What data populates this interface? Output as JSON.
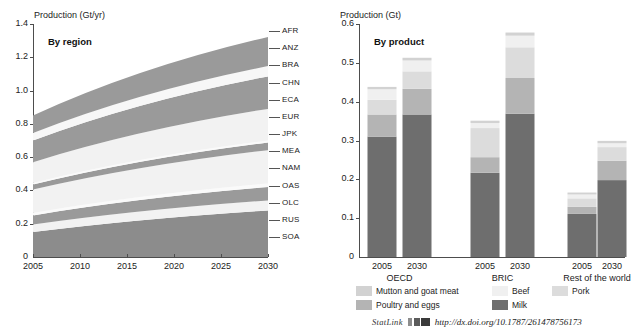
{
  "figure": {
    "statlink": {
      "label": "StatLink",
      "glyph": "statlink-barcode-icon",
      "url": "http://dx.doi.org/10.1787/261478756173"
    }
  },
  "left_panel": {
    "caption": "By region",
    "axis_title": "Production (Gt/yr)"
  },
  "right_panel": {
    "caption": "By product",
    "axis_title": "Production (Gt)"
  },
  "legend": {
    "items": [
      {
        "label": "Mutton and goat meat",
        "color": "#d2d2d2"
      },
      {
        "label": "Beef",
        "color": "#f0f0f0"
      },
      {
        "label": "Pork",
        "color": "#dcdcdc"
      },
      {
        "label": "Poultry and eggs",
        "color": "#b4b4b4"
      },
      {
        "label": "Milk",
        "color": "#6e6e6e"
      }
    ]
  },
  "chart_data": [
    {
      "type": "area",
      "id": "production-by-region",
      "title": "By region",
      "ylabel": "Production (Gt/yr)",
      "xlabel": "",
      "ylim": [
        0,
        1.4
      ],
      "yticks": [
        "0",
        "0.2",
        "0.4",
        "0.6",
        "0.8",
        "1.0",
        "1.2",
        "1.4"
      ],
      "xticks": [
        "2005",
        "2010",
        "2015",
        "2020",
        "2025",
        "2030"
      ],
      "xlim": [
        2005,
        2030
      ],
      "grid": false,
      "stacked": true,
      "note": "Stacked area of world livestock production by region; values are series contributions in Gt/yr at 2005 and 2030.",
      "series": [
        {
          "name": "SOA",
          "label": "SOA",
          "color": "#8c8c8c",
          "values_2005": 0.15,
          "values_2030": 0.28
        },
        {
          "name": "RUS",
          "label": "RUS",
          "color": "#f2f2f2",
          "values_2005": 0.045,
          "values_2030": 0.06
        },
        {
          "name": "OLC",
          "label": "OLC",
          "color": "#9a9a9a",
          "values_2005": 0.055,
          "values_2030": 0.08
        },
        {
          "name": "OAS",
          "label": "OAS",
          "color": "#fafafa",
          "values_2005": 0.015,
          "values_2030": 0.022
        },
        {
          "name": "NAM",
          "label": "NAM",
          "color": "#f2f2f2",
          "values_2005": 0.14,
          "values_2030": 0.2
        },
        {
          "name": "MEA",
          "label": "MEA",
          "color": "#9a9a9a",
          "values_2005": 0.03,
          "values_2030": 0.046
        },
        {
          "name": "JPK",
          "label": "JPK",
          "color": "#fafafa",
          "values_2005": 0.01,
          "values_2030": 0.012
        },
        {
          "name": "EUR",
          "label": "EUR",
          "color": "#f2f2f2",
          "values_2005": 0.125,
          "values_2030": 0.19
        },
        {
          "name": "ECA",
          "label": "ECA",
          "color": "#9a9a9a",
          "values_2005": 0.13,
          "values_2030": 0.195
        },
        {
          "name": "CHN",
          "label": "CHN",
          "color": "#9a9a9a",
          "values_2005": 0.0,
          "values_2030": 0.0
        },
        {
          "name": "BRA",
          "label": "BRA",
          "color": "#f7f7f7",
          "values_2005": 0.045,
          "values_2030": 0.062
        },
        {
          "name": "ANZ",
          "label": "ANZ",
          "color": "#9a9a9a",
          "values_2005": 0.105,
          "values_2030": 0.175
        },
        {
          "name": "AFR",
          "label": "AFR",
          "color": "#9a9a9a",
          "values_2005": 0.0,
          "values_2030": 0.0
        }
      ],
      "total_2005": 0.95,
      "total_2030": 1.38,
      "region_labels": [
        "AFR",
        "ANZ",
        "BRA",
        "CHN",
        "ECA",
        "EUR",
        "JPK",
        "MEA",
        "NAM",
        "OAS",
        "OLC",
        "RUS",
        "SOA"
      ]
    },
    {
      "type": "bar",
      "id": "production-by-product",
      "title": "By product",
      "ylabel": "Production (Gt)",
      "xlabel": "",
      "ylim": [
        0,
        0.6
      ],
      "yticks": [
        "0",
        "0.1",
        "0.2",
        "0.3",
        "0.4",
        "0.5",
        "0.6"
      ],
      "grid": false,
      "stacked": true,
      "categories": [
        "2005",
        "2030",
        "2005",
        "2030",
        "2005",
        "2030"
      ],
      "groups": [
        {
          "name": "OECD",
          "years": [
            "2005",
            "2030"
          ]
        },
        {
          "name": "BRIC",
          "years": [
            "2005",
            "2030"
          ]
        },
        {
          "name": "Rest of the world",
          "years": [
            "2005",
            "2030"
          ]
        }
      ],
      "series": [
        {
          "name": "Milk",
          "color": "#6e6e6e",
          "values": [
            0.31,
            0.367,
            0.217,
            0.369,
            0.111,
            0.198
          ]
        },
        {
          "name": "Poultry and eggs",
          "color": "#b4b4b4",
          "values": [
            0.057,
            0.066,
            0.04,
            0.092,
            0.018,
            0.05
          ]
        },
        {
          "name": "Pork",
          "color": "#dcdcdc",
          "values": [
            0.038,
            0.045,
            0.075,
            0.079,
            0.022,
            0.035
          ]
        },
        {
          "name": "Beef",
          "color": "#f0f0f0",
          "values": [
            0.027,
            0.028,
            0.013,
            0.03,
            0.01,
            0.01
          ]
        },
        {
          "name": "Mutton and goat meat",
          "color": "#d2d2d2",
          "values": [
            0.006,
            0.007,
            0.006,
            0.008,
            0.005,
            0.006
          ]
        }
      ],
      "totals": [
        0.438,
        0.513,
        0.351,
        0.578,
        0.166,
        0.299
      ]
    }
  ]
}
